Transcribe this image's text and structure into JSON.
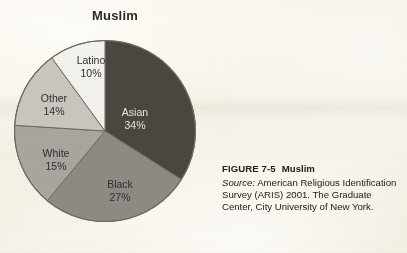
{
  "chart_data": {
    "type": "pie",
    "title": "Muslim",
    "xlabel": "",
    "ylabel": "",
    "categories": [
      "Asian",
      "Black",
      "White",
      "Other",
      "Latino"
    ],
    "values": [
      34,
      27,
      15,
      14,
      10
    ],
    "value_unit": "%",
    "start_angle_deg": 0,
    "direction": "clockwise",
    "legend": "none",
    "grid": false,
    "labels_inside": true,
    "slices": [
      {
        "name": "Asian",
        "value": 34,
        "label": "Asian",
        "value_label": "34%",
        "color": "#4a4740",
        "text_color": "#e9e6de"
      },
      {
        "name": "Black",
        "value": 27,
        "label": "Black",
        "value_label": "27%",
        "color": "#8e8b84",
        "text_color": "#2f2f2f"
      },
      {
        "name": "White",
        "value": 15,
        "label": "White",
        "value_label": "15%",
        "color": "#a9a6a0",
        "text_color": "#2f2f2f"
      },
      {
        "name": "Other",
        "value": 14,
        "label": "Other",
        "value_label": "14%",
        "color": "#c9c6c0",
        "text_color": "#2f2f2f"
      },
      {
        "name": "Latino",
        "value": 10,
        "label": "Latino",
        "value_label": "10%",
        "color": "#f4f2ec",
        "text_color": "#2f2f2f"
      }
    ]
  },
  "caption": {
    "figure_number": "FIGURE 7-5",
    "figure_title": "Muslim",
    "source_word": "Source:",
    "source_text": " American Religious Identification Survey (ARIS) 2001. The Graduate Center, City University of New York."
  },
  "colors": {
    "page_background": "#f5f0e8",
    "outline": "#6d6a64",
    "title_text": "#2b2b2b",
    "caption_text": "#24201c"
  }
}
